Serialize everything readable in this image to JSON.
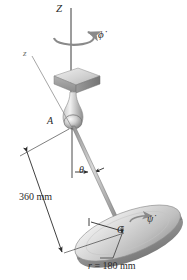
{
  "figure": {
    "background_color": "#ffffff",
    "ink_color": "#2a2a2a",
    "metal_light": "#e8e8e8",
    "metal_mid": "#b9b9b9",
    "metal_dark": "#8f8f8f"
  },
  "labels": {
    "vertical_axis": "Z",
    "precession_rate": "ϕ̇",
    "body_axis": "z",
    "joint": "A",
    "nutation_angle": "θ",
    "arm_length": "360 mm",
    "mass_center": "G",
    "spin_rate": "ψ̇",
    "radius_prefix": "r",
    "radius_equals": " = ",
    "radius_value": "180 mm"
  },
  "geometry": {
    "arm_length_mm": 360,
    "disk_radius_mm": 180
  }
}
